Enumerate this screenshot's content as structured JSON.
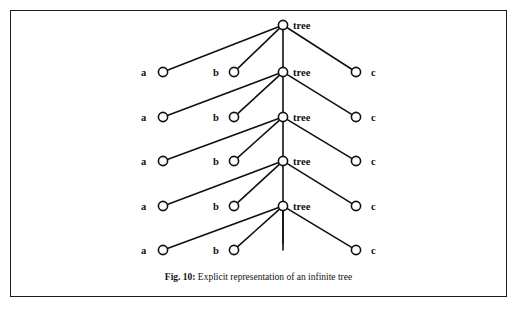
{
  "figure": {
    "caption_number": "Fig. 10:",
    "caption_text": "Explicit representation of an infinite tree",
    "border_color": "#1b1b1b",
    "background_color": "#ffffff",
    "ink_color": "#111111"
  },
  "diagram": {
    "type": "node-link-tree",
    "node_radius": 4.6,
    "spine_x": 283,
    "rows": [
      {
        "index": 0,
        "center_label": "tree",
        "center_x": 283,
        "center_y": 25,
        "has_center_node": true,
        "center_label_x": 293,
        "center_label_y": 21,
        "leaves": []
      },
      {
        "index": 1,
        "center_label": "tree",
        "center_x": 283,
        "center_y": 72,
        "has_center_node": true,
        "center_label_x": 293,
        "center_label_y": 68,
        "leaves": [
          {
            "label": "a",
            "cx": 163,
            "cy": 72,
            "label_x": 141,
            "label_y": 68
          },
          {
            "label": "b",
            "cx": 234,
            "cy": 72,
            "label_x": 213,
            "label_y": 68
          },
          {
            "label": "c",
            "cx": 356,
            "cy": 72,
            "label_x": 371,
            "label_y": 68
          }
        ]
      },
      {
        "index": 2,
        "center_label": "tree",
        "center_x": 283,
        "center_y": 117,
        "has_center_node": true,
        "center_label_x": 293,
        "center_label_y": 113,
        "leaves": [
          {
            "label": "a",
            "cx": 163,
            "cy": 117,
            "label_x": 141,
            "label_y": 113
          },
          {
            "label": "b",
            "cx": 234,
            "cy": 117,
            "label_x": 213,
            "label_y": 113
          },
          {
            "label": "c",
            "cx": 356,
            "cy": 117,
            "label_x": 371,
            "label_y": 113
          }
        ]
      },
      {
        "index": 3,
        "center_label": "tree",
        "center_x": 283,
        "center_y": 161,
        "has_center_node": true,
        "center_label_x": 293,
        "center_label_y": 157,
        "leaves": [
          {
            "label": "a",
            "cx": 163,
            "cy": 161,
            "label_x": 141,
            "label_y": 157
          },
          {
            "label": "b",
            "cx": 234,
            "cy": 161,
            "label_x": 213,
            "label_y": 157
          },
          {
            "label": "c",
            "cx": 356,
            "cy": 161,
            "label_x": 371,
            "label_y": 157
          }
        ]
      },
      {
        "index": 4,
        "center_label": "tree",
        "center_x": 283,
        "center_y": 206,
        "has_center_node": true,
        "center_label_x": 293,
        "center_label_y": 202,
        "leaves": [
          {
            "label": "a",
            "cx": 163,
            "cy": 206,
            "label_x": 141,
            "label_y": 202
          },
          {
            "label": "b",
            "cx": 234,
            "cy": 206,
            "label_x": 213,
            "label_y": 202
          },
          {
            "label": "c",
            "cx": 356,
            "cy": 206,
            "label_x": 371,
            "label_y": 202
          }
        ]
      },
      {
        "index": 5,
        "center_label": "",
        "center_x": 283,
        "center_y": 250,
        "has_center_node": false,
        "center_label_x": 293,
        "center_label_y": 246,
        "leaves": [
          {
            "label": "a",
            "cx": 163,
            "cy": 250,
            "label_x": 141,
            "label_y": 246
          },
          {
            "label": "b",
            "cx": 234,
            "cy": 250,
            "label_x": 213,
            "label_y": 246
          },
          {
            "label": "c",
            "cx": 356,
            "cy": 250,
            "label_x": 371,
            "label_y": 246
          }
        ]
      }
    ],
    "stub": {
      "x": 283,
      "y_top": 206,
      "y_bottom": 243
    }
  }
}
